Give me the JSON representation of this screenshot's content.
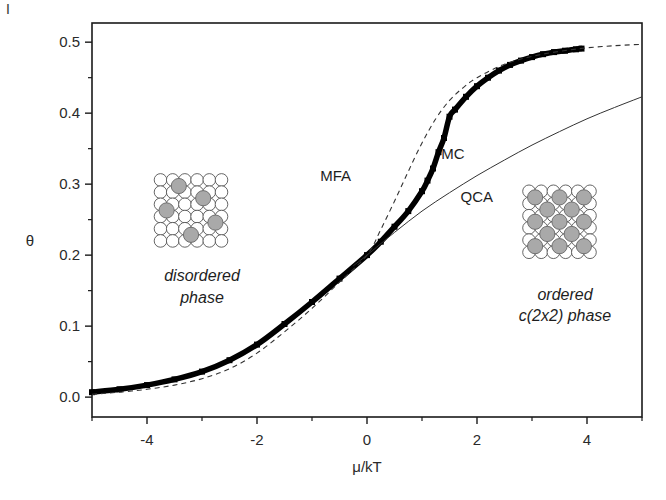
{
  "chart_data": {
    "type": "line",
    "title": "",
    "corner_mark": "I",
    "xlabel": "μ/kT",
    "ylabel": "θ",
    "xlim": [
      -5,
      5
    ],
    "ylim": [
      -0.028,
      0.527
    ],
    "xticks": [
      -4,
      -2,
      0,
      2,
      4
    ],
    "xtick_labels": [
      "-4",
      "-2",
      "0",
      "2",
      "4"
    ],
    "x_minor_ticks": [
      -5,
      -3,
      -1,
      1,
      3,
      5
    ],
    "yticks": [
      0.0,
      0.1,
      0.2,
      0.3,
      0.4,
      0.5
    ],
    "ytick_labels": [
      "0.0",
      "0.1",
      "0.2",
      "0.3",
      "0.4",
      "0.5"
    ],
    "y_minor_ticks": [
      0.05,
      0.15,
      0.25,
      0.35,
      0.45
    ],
    "grid": false,
    "series": [
      {
        "name": "MC",
        "style": "thick-markers",
        "color": "#000000",
        "x": [
          -5.0,
          -4.5,
          -4.0,
          -3.5,
          -3.0,
          -2.5,
          -2.0,
          -1.5,
          -1.0,
          -0.5,
          0.0,
          0.25,
          0.5,
          0.75,
          1.0,
          1.1,
          1.2,
          1.3,
          1.4,
          1.5,
          1.6,
          1.8,
          2.0,
          2.2,
          2.4,
          2.6,
          2.8,
          3.0,
          3.2,
          3.4,
          3.6,
          3.8,
          3.9
        ],
        "y": [
          0.007,
          0.011,
          0.017,
          0.025,
          0.036,
          0.052,
          0.074,
          0.103,
          0.134,
          0.167,
          0.2,
          0.219,
          0.24,
          0.262,
          0.29,
          0.305,
          0.322,
          0.345,
          0.365,
          0.395,
          0.405,
          0.423,
          0.438,
          0.45,
          0.46,
          0.468,
          0.474,
          0.479,
          0.483,
          0.486,
          0.488,
          0.49,
          0.491
        ]
      },
      {
        "name": "MFA",
        "style": "dashed",
        "color": "#333333",
        "x": [
          -5.0,
          -4.5,
          -4.0,
          -3.5,
          -3.0,
          -2.5,
          -2.0,
          -1.5,
          -1.0,
          -0.5,
          0.0,
          0.25,
          0.5,
          0.75,
          1.0,
          1.25,
          1.5,
          1.75,
          2.0,
          2.5,
          3.0,
          3.5,
          4.0,
          4.5,
          5.0
        ],
        "y": [
          0.004,
          0.007,
          0.011,
          0.017,
          0.026,
          0.04,
          0.062,
          0.092,
          0.125,
          0.162,
          0.2,
          0.236,
          0.276,
          0.318,
          0.358,
          0.392,
          0.418,
          0.436,
          0.45,
          0.469,
          0.48,
          0.487,
          0.492,
          0.495,
          0.497
        ]
      },
      {
        "name": "QCA",
        "style": "thin-solid",
        "color": "#333333",
        "x": [
          -0.25,
          0.0,
          0.5,
          1.0,
          1.5,
          2.0,
          2.5,
          3.0,
          3.5,
          4.0,
          4.5,
          5.0
        ],
        "y": [
          0.185,
          0.2,
          0.232,
          0.262,
          0.288,
          0.312,
          0.334,
          0.355,
          0.374,
          0.392,
          0.408,
          0.423
        ]
      }
    ],
    "annotations": [
      {
        "id": "mfa",
        "text": "MFA",
        "x": -0.85,
        "y": 0.305
      },
      {
        "id": "mc",
        "text": "MC",
        "x": 1.35,
        "y": 0.335
      },
      {
        "id": "qca",
        "text": "QCA",
        "x": 1.7,
        "y": 0.275
      },
      {
        "id": "disordered-line1",
        "text": "disordered",
        "x": -3.0,
        "y": 0.163
      },
      {
        "id": "disordered-line2",
        "text": "phase",
        "x": -3.0,
        "y": 0.133
      },
      {
        "id": "ordered-line1",
        "text": "ordered",
        "x": 3.6,
        "y": 0.137
      },
      {
        "id": "ordered-line2",
        "text": "c(2x2) phase",
        "x": 3.6,
        "y": 0.107
      }
    ],
    "insets": [
      {
        "id": "disordered-lattice",
        "grid": 6,
        "center_x": -3.2,
        "center_y": 0.263,
        "adsorbates_count": 5
      },
      {
        "id": "ordered-lattice",
        "grid": 6,
        "center_x": 3.5,
        "center_y": 0.247,
        "adsorbates_count": 13
      }
    ]
  }
}
